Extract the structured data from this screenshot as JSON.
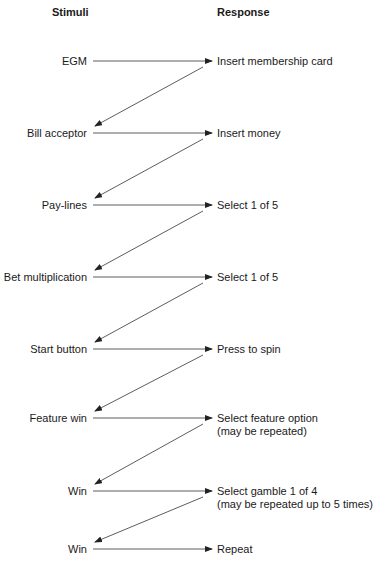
{
  "headers": {
    "stimuli": "Stimuli",
    "response": "Response"
  },
  "rows": [
    {
      "stimulus": "EGM",
      "response": [
        "Insert membership card"
      ],
      "y": 61
    },
    {
      "stimulus": "Bill acceptor",
      "response": [
        "Insert money"
      ],
      "y": 133
    },
    {
      "stimulus": "Pay-lines",
      "response": [
        "Select 1 of 5"
      ],
      "y": 205
    },
    {
      "stimulus": "Bet multiplication",
      "response": [
        "Select 1 of 5"
      ],
      "y": 277
    },
    {
      "stimulus": "Start button",
      "response": [
        "Press to spin"
      ],
      "y": 349
    },
    {
      "stimulus": "Feature win",
      "response": [
        "Select feature option",
        "(may be repeated)"
      ],
      "y": 418
    },
    {
      "stimulus": "Win",
      "response": [
        "Select gamble 1 of 4",
        "(may be repeated up to 5 times)"
      ],
      "y": 491
    },
    {
      "stimulus": "Win",
      "response": [
        "Repeat"
      ],
      "y": 549
    }
  ],
  "colors": {
    "line": "#333333",
    "text": "#1a1a1a"
  }
}
